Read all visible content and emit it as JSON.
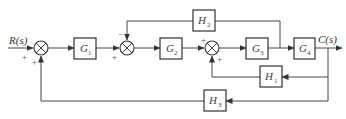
{
  "diagram": {
    "type": "control-system-block-diagram",
    "input_label": "R(s)",
    "output_label": "C(s)",
    "blocks": {
      "G1": {
        "name": "G",
        "sub": "1"
      },
      "G2": {
        "name": "G",
        "sub": "2"
      },
      "G3": {
        "name": "G",
        "sub": "3"
      },
      "G4": {
        "name": "G",
        "sub": "4"
      },
      "H1": {
        "name": "H",
        "sub": "1"
      },
      "H2": {
        "name": "H",
        "sub": "2"
      },
      "H3": {
        "name": "H",
        "sub": "3"
      }
    },
    "summing_junctions": [
      {
        "id": "S1",
        "signs": {
          "input": "+",
          "feedback": "+"
        }
      },
      {
        "id": "S2",
        "signs": {
          "input": "+",
          "feedback": "−"
        }
      },
      {
        "id": "S3",
        "signs": {
          "input": "+",
          "feedback": "+"
        }
      }
    ],
    "signs": {
      "s1_in": "+",
      "s1_fb": "+",
      "s2_in": "+",
      "s2_fb": "−",
      "s3_in": "+",
      "s3_fb": "+"
    },
    "connections": [
      "R(s) -> S1(+)",
      "S1 -> G1 -> S2(+)",
      "S2 -> G2 -> S3(+)",
      "S3 -> G3 -> G4 -> C(s)",
      "G3 output -> H2 -> S2(−)",
      "C(s) -> H1 -> S3(+)",
      "C(s) -> H3 -> S1(+)"
    ]
  }
}
